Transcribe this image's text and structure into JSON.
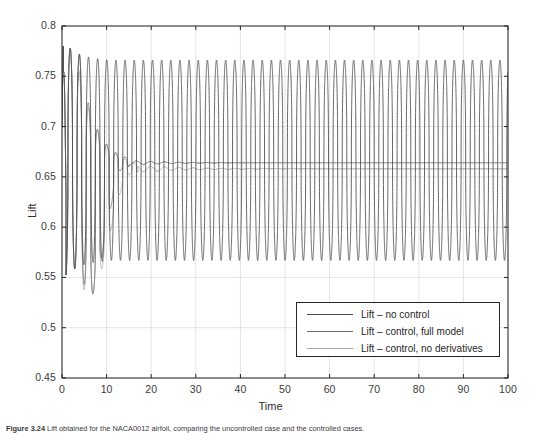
{
  "figure": {
    "background": "#ffffff",
    "axes_color": "#262626",
    "grid_color": "#e4e4e4",
    "plot_box": {
      "left": 62,
      "top": 26,
      "right": 508,
      "bottom": 378
    }
  },
  "axis_titles": {
    "x": "Time",
    "y": "Lift"
  },
  "caption": {
    "prefix": "Figure 3.24",
    "text": "Lift obtained for the NACA0012 airfoil, comparing the uncontrolled case and the controlled cases."
  },
  "legend": {
    "position": "inside-bottom-right",
    "entries": [
      {
        "label": "Lift – no control",
        "color": "#4c4c4c"
      },
      {
        "label": "Lift – control, full model",
        "color": "#6e6e6e"
      },
      {
        "label": "Lift – control, no derivatives",
        "color": "#a8a8a8"
      }
    ]
  },
  "chart_data": {
    "type": "line",
    "title": "",
    "xlabel": "Time",
    "ylabel": "Lift",
    "xlim": [
      0,
      100
    ],
    "ylim": [
      0.45,
      0.8
    ],
    "xticks": [
      0,
      10,
      20,
      30,
      40,
      50,
      60,
      70,
      80,
      90,
      100
    ],
    "yticks": [
      0.45,
      0.5,
      0.55,
      0.6,
      0.65,
      0.7,
      0.75,
      0.8
    ],
    "grid": true,
    "series": [
      {
        "name": "Lift – no control",
        "color": "#4c4c4c",
        "description": "Sustained limit-cycle oscillation, period about 2.05 time units, starting with a large first peak near 0.787 then settling to a steady oscillation between about 0.567 and 0.766 with mean near 0.666.",
        "kind": "oscillation",
        "params": {
          "period": 2.05,
          "phase": 0.35,
          "start_peak": 0.787,
          "steady_max": 0.766,
          "steady_min": 0.567,
          "mean": 0.6665,
          "settle_time": 10,
          "peak_sharpness": 2.6,
          "trough_sharpness": 2.2
        }
      },
      {
        "name": "Lift – control, full model",
        "color": "#6e6e6e",
        "description": "Starts in the oscillation, control engaged near t=4 drives large transient swings down to about 0.50 by t=13, then converges to a nearly flat value of about 0.664.",
        "kind": "controlled",
        "params": {
          "period": 2.05,
          "phase": 0.35,
          "control_on": 4.2,
          "transient_end": 15,
          "min_dip": 0.498,
          "final": 0.664,
          "ripple": 0.0022,
          "ripple_decay": 26
        }
      },
      {
        "name": "Lift – control, no derivatives",
        "color": "#a8a8a8",
        "description": "Similar controlled response with slightly larger early transient and a lower dip near 0.497, converging to about 0.658 with a small residual ripple that decays by t=45.",
        "kind": "controlled",
        "params": {
          "period": 2.05,
          "phase": 0.35,
          "control_on": 3.6,
          "transient_end": 17,
          "min_dip": 0.497,
          "final": 0.658,
          "ripple": 0.0035,
          "ripple_decay": 30
        }
      }
    ]
  }
}
